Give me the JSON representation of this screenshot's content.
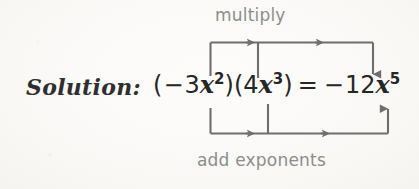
{
  "figure": {
    "type": "annotated-equation-diagram",
    "background_color": "#fbfaf8",
    "solution_label": "Solution:",
    "equation": {
      "full_text": "(−3x²)(4x³) = −12x⁵",
      "left_paren_1": "(",
      "minus_1": "−",
      "coefficient_1": "3",
      "variable_1": "x",
      "exponent_1": "2",
      "right_paren_1": ")",
      "left_paren_2": "(",
      "coefficient_2": "4",
      "variable_2": "x",
      "exponent_2": "3",
      "right_paren_2": ")",
      "equals": "=",
      "minus_2": "−",
      "result_coefficient": "12",
      "result_variable": "x",
      "result_exponent": "5"
    },
    "annotations": {
      "top_label": "multiply",
      "bottom_label": "add exponents"
    },
    "colors": {
      "equation_text": "#262626",
      "solution_text": "#2f2f2f",
      "annotation_text": "#8d8d8d",
      "arrow_stroke": "#6e6e6e"
    }
  }
}
